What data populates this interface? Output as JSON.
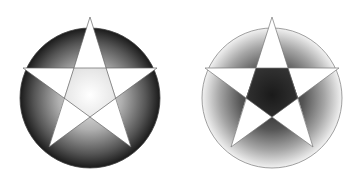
{
  "figures": [
    {
      "name": "pentagram-dark-circle",
      "center": [
        90,
        98
      ],
      "radius": 70,
      "circle_style": "radial gradient dark edge to light center",
      "star_fill": "#ffffff",
      "inner_pentagon": "light gradient",
      "colors": {
        "edge": "#1a1a1a",
        "mid": "#6a6a6a",
        "center": "#f4f4f4",
        "stroke": "#555555"
      }
    },
    {
      "name": "pentagram-light-circle",
      "center": [
        272,
        98
      ],
      "radius": 70,
      "circle_style": "radial gradient light edge to dark inner",
      "star_fill": "#ffffff",
      "inner_pentagon": "dark gradient",
      "colors": {
        "edge": "#f2f2f2",
        "mid": "#8a8a8a",
        "center": "#1e1e1e",
        "stroke": "#888888"
      }
    }
  ]
}
